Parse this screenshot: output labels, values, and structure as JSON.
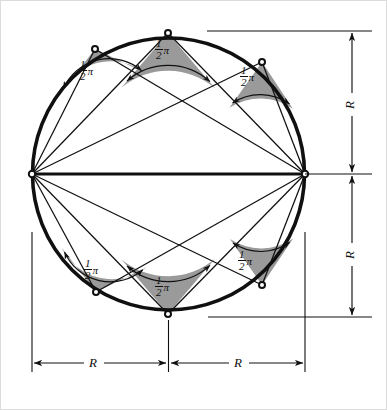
{
  "figure": {
    "background_color": "#ffffff",
    "stroke_color": "#101010",
    "wedge_fill_color": "#9a9a9a",
    "border_color": "#d8d8d8"
  },
  "geometry": {
    "center": {
      "x": 168.5,
      "y": 174
    },
    "radius": 136,
    "diameter_endpoints": [
      {
        "name": "left-diameter-endpoint",
        "x": 32,
        "y": 174
      },
      {
        "name": "right-diameter-endpoint",
        "x": 305,
        "y": 174
      }
    ],
    "arc_points": [
      {
        "name": "upper-left-vertex",
        "x": 95,
        "y": 49
      },
      {
        "name": "upper-middle-vertex",
        "x": 168,
        "y": 33
      },
      {
        "name": "upper-right-vertex",
        "x": 262,
        "y": 62
      },
      {
        "name": "lower-left-vertex",
        "x": 96,
        "y": 292
      },
      {
        "name": "lower-middle-vertex",
        "x": 168,
        "y": 314
      },
      {
        "name": "lower-right-vertex",
        "x": 262,
        "y": 285
      }
    ]
  },
  "angle_labels": [
    {
      "id": "angle-upper-left",
      "numerator": "1",
      "denominator": "2",
      "symbol": "π",
      "x": 83,
      "y": 66
    },
    {
      "id": "angle-upper-middle",
      "numerator": "1",
      "denominator": "2",
      "symbol": "π",
      "x": 155,
      "y": 43
    },
    {
      "id": "angle-upper-right",
      "numerator": "1",
      "denominator": "2",
      "symbol": "π",
      "x": 240,
      "y": 73
    },
    {
      "id": "angle-lower-left",
      "numerator": "1",
      "denominator": "2",
      "symbol": "π",
      "x": 86,
      "y": 262
    },
    {
      "id": "angle-lower-middle",
      "numerator": "1",
      "denominator": "2",
      "symbol": "π",
      "x": 155,
      "y": 282
    },
    {
      "id": "angle-lower-right",
      "numerator": "1",
      "denominator": "2",
      "symbol": "π",
      "x": 238,
      "y": 256
    }
  ],
  "dimensions": {
    "right_top": {
      "label": "R",
      "orientation": "vertical",
      "x": 352,
      "y": 103
    },
    "right_bottom": {
      "label": "R",
      "orientation": "vertical",
      "x": 352,
      "y": 253
    },
    "bottom_left": {
      "label": "R",
      "orientation": "horizontal",
      "x": 93,
      "y": 363
    },
    "bottom_right": {
      "label": "R",
      "orientation": "horizontal",
      "x": 238,
      "y": 363
    }
  }
}
